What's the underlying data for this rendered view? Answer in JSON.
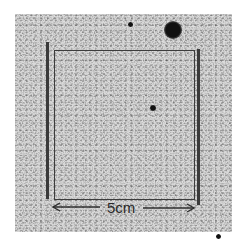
{
  "image": {
    "description": "Grainy photographic plate showing a square region outlined between two dark vertical bars with a scale bar",
    "scale_bar": {
      "label": "5cm",
      "left_arrow": "←",
      "right_arrow": "→"
    },
    "colors": {
      "background": "#ffffff",
      "plate": "#d9d9d9",
      "lines": "#3a3a3a",
      "dark_spots": "#111111"
    },
    "features": [
      {
        "type": "large-dark-spot",
        "x": 173,
        "y": 30,
        "radius": 8
      },
      {
        "type": "small-dark-spot",
        "x": 130,
        "y": 24,
        "radius": 2
      },
      {
        "type": "small-dark-spot",
        "x": 153,
        "y": 108,
        "radius": 2.5
      },
      {
        "type": "small-dark-spot",
        "x": 218,
        "y": 236,
        "radius": 2
      }
    ]
  }
}
